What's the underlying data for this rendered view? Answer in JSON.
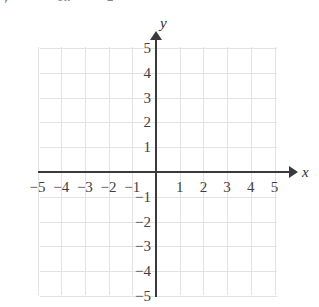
{
  "figure": {
    "type": "blank-coordinate-grid",
    "clipped_text_above": {
      "fragment_left": "y",
      "fragment_mid": "en",
      "fragment_right": "2"
    },
    "axis_labels": {
      "x": "x",
      "y": "y"
    },
    "colors": {
      "axis": "#3a3a3a",
      "grid": "#e3e3e3",
      "label": "#3f3f3f",
      "background": "#ffffff"
    }
  },
  "chart_data": {
    "type": "scatter",
    "title": "",
    "xlabel": "x",
    "ylabel": "y",
    "xlim": [
      -5,
      5
    ],
    "ylim": [
      -5,
      5
    ],
    "grid": true,
    "legend": "none",
    "x_ticks": [
      "-5",
      "-4",
      "-3",
      "-2",
      "-1",
      "1",
      "2",
      "3",
      "4",
      "5"
    ],
    "y_ticks": [
      "5",
      "4",
      "3",
      "2",
      "1",
      "-1",
      "-2",
      "-3",
      "-4",
      "-5"
    ],
    "x_tick_values": [
      -5,
      -4,
      -3,
      -2,
      -1,
      1,
      2,
      3,
      4,
      5
    ],
    "y_tick_values": [
      5,
      4,
      3,
      2,
      1,
      -1,
      -2,
      -3,
      -4,
      -5
    ],
    "series": [],
    "values": [],
    "annotations": []
  }
}
